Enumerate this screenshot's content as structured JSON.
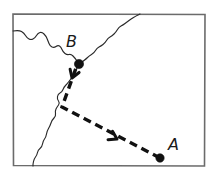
{
  "figure": {
    "kind": "hand-drawn-sketch-map",
    "width": 216,
    "height": 181,
    "background_color": "#ffffff",
    "frame": {
      "stroke_color": "#6b6b6b",
      "x": 13,
      "y": 14,
      "width": 192,
      "height": 152
    }
  },
  "colors": {
    "ink": "#111111",
    "river_ink": "#2a2a2a",
    "frame_ink": "#6b6b6b",
    "paper": "#ffffff"
  },
  "waypoints": [
    {
      "id": "A",
      "label": "A",
      "dot_x": 160,
      "dot_y": 158,
      "dot_radius": 4.2,
      "label_x": 168,
      "label_y": 150
    },
    {
      "id": "B",
      "label": "B",
      "dot_x": 79,
      "dot_y": 64,
      "dot_radius": 4.6,
      "label_x": 66,
      "label_y": 47
    }
  ],
  "route": {
    "name": "route-a-to-b",
    "direction": "A to B",
    "style": "dashed",
    "dash_pattern": "8 5",
    "stroke_width": 3.4,
    "points": [
      {
        "x": 160,
        "y": 158
      },
      {
        "x": 62,
        "y": 107
      },
      {
        "x": 76,
        "y": 68
      }
    ],
    "arrowheads": [
      {
        "name": "route-arrowhead-mid",
        "x": 117,
        "y": 139,
        "angle_deg": 208
      },
      {
        "name": "route-arrowhead-at-b",
        "x": 72,
        "y": 78,
        "angle_deg": 290
      }
    ]
  },
  "river": {
    "name": "river-coastline",
    "description": "wavy line entering at left edge, passing through B, exiting top edge, and branching down to bottom edge",
    "stroke_width": 1.15,
    "segments": [
      {
        "name": "river-upper-left",
        "points": [
          {
            "x": 13,
            "y": 31
          },
          {
            "x": 19,
            "y": 30
          },
          {
            "x": 24,
            "y": 33
          },
          {
            "x": 27,
            "y": 38
          },
          {
            "x": 31,
            "y": 40
          },
          {
            "x": 35,
            "y": 38
          },
          {
            "x": 38,
            "y": 33
          },
          {
            "x": 42,
            "y": 32
          },
          {
            "x": 46,
            "y": 36
          },
          {
            "x": 48,
            "y": 41
          },
          {
            "x": 50,
            "y": 46
          },
          {
            "x": 54,
            "y": 48
          },
          {
            "x": 58,
            "y": 45
          },
          {
            "x": 61,
            "y": 47
          },
          {
            "x": 63,
            "y": 52
          },
          {
            "x": 67,
            "y": 55
          },
          {
            "x": 71,
            "y": 54
          },
          {
            "x": 75,
            "y": 58
          },
          {
            "x": 79,
            "y": 64
          }
        ]
      },
      {
        "name": "river-upper-right",
        "points": [
          {
            "x": 79,
            "y": 64
          },
          {
            "x": 85,
            "y": 60
          },
          {
            "x": 89,
            "y": 56
          },
          {
            "x": 94,
            "y": 53
          },
          {
            "x": 97,
            "y": 48
          },
          {
            "x": 101,
            "y": 46
          },
          {
            "x": 105,
            "y": 43
          },
          {
            "x": 108,
            "y": 38
          },
          {
            "x": 112,
            "y": 36
          },
          {
            "x": 116,
            "y": 32
          },
          {
            "x": 119,
            "y": 27
          },
          {
            "x": 123,
            "y": 25
          },
          {
            "x": 127,
            "y": 22
          },
          {
            "x": 131,
            "y": 19
          },
          {
            "x": 136,
            "y": 16
          },
          {
            "x": 140,
            "y": 14
          }
        ]
      },
      {
        "name": "river-lower-branch",
        "points": [
          {
            "x": 79,
            "y": 64
          },
          {
            "x": 76,
            "y": 70
          },
          {
            "x": 73,
            "y": 76
          },
          {
            "x": 70,
            "y": 80
          },
          {
            "x": 67,
            "y": 84
          },
          {
            "x": 64,
            "y": 87
          },
          {
            "x": 62,
            "y": 92
          },
          {
            "x": 58,
            "y": 94
          },
          {
            "x": 57,
            "y": 99
          },
          {
            "x": 60,
            "y": 103
          },
          {
            "x": 57,
            "y": 107
          },
          {
            "x": 55,
            "y": 111
          },
          {
            "x": 56,
            "y": 116
          },
          {
            "x": 52,
            "y": 120
          },
          {
            "x": 50,
            "y": 126
          },
          {
            "x": 47,
            "y": 131
          },
          {
            "x": 46,
            "y": 137
          },
          {
            "x": 43,
            "y": 141
          },
          {
            "x": 42,
            "y": 147
          },
          {
            "x": 38,
            "y": 150
          },
          {
            "x": 37,
            "y": 155
          },
          {
            "x": 34,
            "y": 159
          },
          {
            "x": 33,
            "y": 164
          },
          {
            "x": 33,
            "y": 166
          }
        ]
      }
    ]
  }
}
